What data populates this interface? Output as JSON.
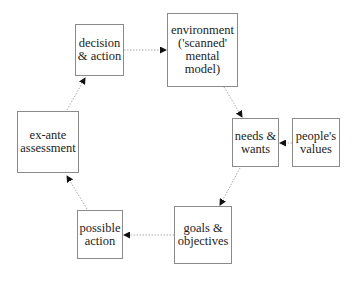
{
  "diagram": {
    "nodes": {
      "decision": "decision\n& action",
      "environment": "environment\n('scanned'\nmental\nmodel)",
      "needs": "needs &\nwants",
      "values": "people's\nvalues",
      "goals": "goals &\nobjectives",
      "possible": "possible\naction",
      "exante": "ex-ante\nassessment"
    },
    "edges": [
      {
        "from": "decision",
        "to": "environment",
        "style": "dotted"
      },
      {
        "from": "environment",
        "to": "needs",
        "style": "dotted"
      },
      {
        "from": "values",
        "to": "needs",
        "style": "dotted"
      },
      {
        "from": "needs",
        "to": "goals",
        "style": "dotted"
      },
      {
        "from": "goals",
        "to": "possible",
        "style": "dotted"
      },
      {
        "from": "possible",
        "to": "exante",
        "style": "dotted"
      },
      {
        "from": "exante",
        "to": "decision",
        "style": "dotted"
      }
    ],
    "colors": {
      "border": "#8a8a8a",
      "edge": "#aaaaaa",
      "arrowhead": "#111111"
    }
  }
}
